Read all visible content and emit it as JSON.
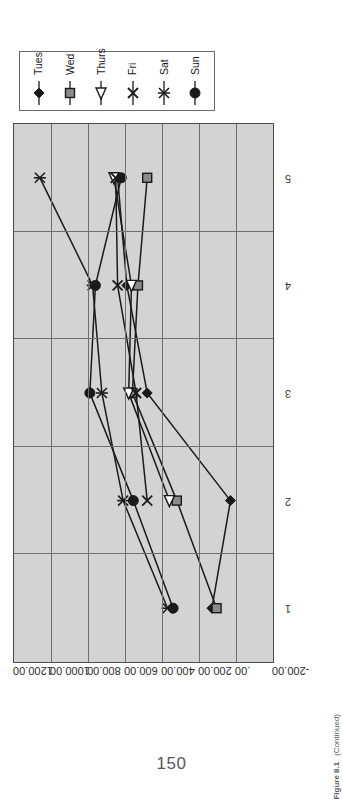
{
  "page": {
    "number": "150",
    "figure_label": "Figure 8.1",
    "figure_continued": "(Continued)"
  },
  "chart_data": {
    "type": "line",
    "title": "",
    "xlabel": "",
    "ylabel": "",
    "categories": [
      "1",
      "2",
      "3",
      "4",
      "5"
    ],
    "x": [
      1,
      2,
      3,
      4,
      5
    ],
    "ytick_labels": [
      "1200.00",
      "1000.00",
      "800.00",
      "600.00",
      "400.00",
      "200.00",
      ".00",
      "-200.00"
    ],
    "ytick_values": [
      1200,
      1000,
      800,
      600,
      400,
      200,
      0,
      -200
    ],
    "ylim": [
      -200,
      1200
    ],
    "grid": true,
    "legend_position": "right-outside",
    "plot_background": "#d3d3d3",
    "line_color": "#1a1a1a",
    "series": [
      {
        "name": "Tues",
        "marker": "diamond",
        "values": [
          130,
          30,
          480,
          590,
          640
        ]
      },
      {
        "name": "Wed",
        "marker": "square",
        "values": [
          105,
          320,
          560,
          530,
          480
        ]
      },
      {
        "name": "Thurs",
        "marker": "triangle",
        "values": [
          null,
          360,
          580,
          565,
          660
        ]
      },
      {
        "name": "Fri",
        "marker": "cross",
        "values": [
          null,
          480,
          540,
          640,
          650
        ]
      },
      {
        "name": "Sat",
        "marker": "asterisk",
        "values": [
          370,
          610,
          725,
          775,
          1060
        ]
      },
      {
        "name": "Sun",
        "marker": "circle",
        "values": [
          340,
          555,
          790,
          760,
          620
        ]
      }
    ]
  },
  "legend": {
    "entries": [
      {
        "label": "Tues",
        "marker": "diamond-marker"
      },
      {
        "label": "Wed",
        "marker": "square-marker"
      },
      {
        "label": "Thurs",
        "marker": "triangle-marker"
      },
      {
        "label": "Fri",
        "marker": "cross-marker"
      },
      {
        "label": "Sat",
        "marker": "asterisk-marker"
      },
      {
        "label": "Sun",
        "marker": "circle-marker"
      }
    ]
  }
}
